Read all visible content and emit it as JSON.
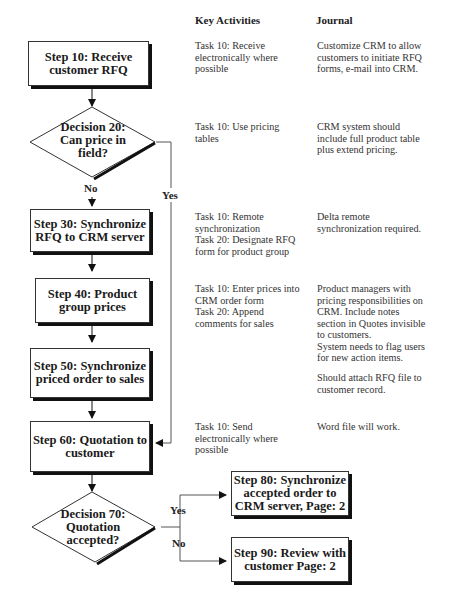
{
  "headers": {
    "key_activities": "Key Activities",
    "journal": "Journal"
  },
  "steps": [
    {
      "id": "step10",
      "label": "Step 10: Receive customer RFQ"
    },
    {
      "id": "decision20",
      "label": "Decision 20: Can price in field?"
    },
    {
      "id": "step30",
      "label": "Step 30: Synchronize RFQ to CRM server"
    },
    {
      "id": "step40",
      "label": "Step 40: Product group prices"
    },
    {
      "id": "step50",
      "label": "Step 50: Synchronize priced order to sales"
    },
    {
      "id": "step60",
      "label": "Step 60: Quotation to customer"
    },
    {
      "id": "decision70",
      "label": "Decision 70: Quotation accepted?"
    },
    {
      "id": "step80",
      "label": "Step 80: Synchronize accepted order to CRM server, Page: 2"
    },
    {
      "id": "step90",
      "label": "Step 90: Review with customer Page: 2"
    }
  ],
  "branch_labels": {
    "d20_no": "No",
    "d20_yes": "Yes",
    "d70_yes": "Yes",
    "d70_no": "No"
  },
  "key_activities": {
    "step10": "Task 10: Receive\nelectronically where\npossible",
    "decision20": "Task 10: Use pricing\ntables",
    "step30": "Task 10: Remote\nsynchronization\nTask 20: Designate RFQ\nform for product group",
    "step40": "Task 10: Enter prices into\nCRM order form\nTask 20: Append\ncomments for sales",
    "step60": "Task 10: Send\nelectronically where\npossible"
  },
  "journal": {
    "step10": "Customize CRM to allow\ncustomers to initiate RFQ\nforms, e-mail into CRM.",
    "decision20": "CRM system should\ninclude full product table\nplus extend pricing.",
    "step30": "Delta remote\nsynchronization required.",
    "step40": "Product managers with\npricing responsibilities on\nCRM. Include notes\nsection in Quotes invisible\nto customers.\nSystem needs to flag users\nfor new action items.",
    "step50": "Should attach RFQ file to\ncustomer record.",
    "step60": "Word file will work."
  }
}
